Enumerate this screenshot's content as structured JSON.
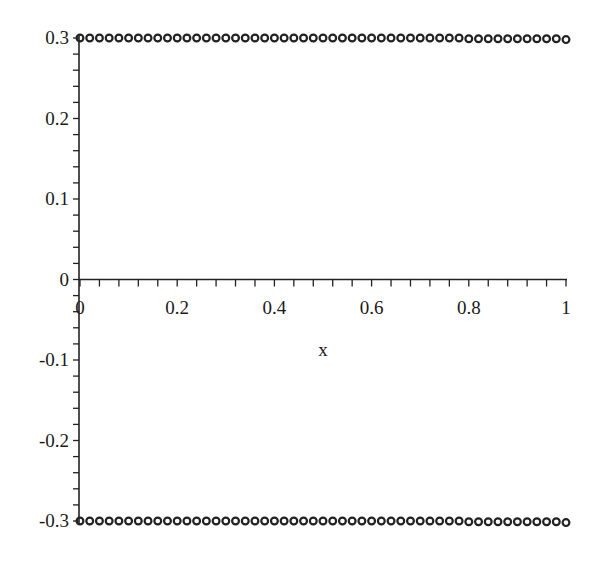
{
  "chart_data": {
    "type": "scatter",
    "title": "",
    "xlabel": "x",
    "ylabel": "",
    "xlim": [
      0,
      1
    ],
    "ylim": [
      -0.3,
      0.3
    ],
    "grid": false,
    "legend": null,
    "x_ticks": [
      {
        "value": 0,
        "label": "0"
      },
      {
        "value": 0.2,
        "label": "0.2"
      },
      {
        "value": 0.4,
        "label": "0.4"
      },
      {
        "value": 0.6,
        "label": "0.6"
      },
      {
        "value": 0.8,
        "label": "0.8"
      },
      {
        "value": 1,
        "label": "1"
      }
    ],
    "y_ticks": [
      {
        "value": 0.3,
        "label": "0.3"
      },
      {
        "value": 0.2,
        "label": "0.2"
      },
      {
        "value": 0.1,
        "label": "0.1"
      },
      {
        "value": 0,
        "label": "0"
      },
      {
        "value": -0.1,
        "label": "-0.1"
      },
      {
        "value": -0.2,
        "label": "-0.2"
      },
      {
        "value": -0.3,
        "label": "-0.3"
      }
    ],
    "x_minor_step": 0.04,
    "y_minor_step": 0.02,
    "marker": "circle",
    "marker_color": "#222222",
    "axis_color": "#222222",
    "series": [
      {
        "name": "upper",
        "x": [
          0,
          0.02,
          0.04,
          0.06,
          0.08,
          0.1,
          0.12,
          0.14,
          0.16,
          0.18,
          0.2,
          0.22,
          0.24,
          0.26,
          0.28,
          0.3,
          0.32,
          0.34,
          0.36,
          0.38,
          0.4,
          0.42,
          0.44,
          0.46,
          0.48,
          0.5,
          0.52,
          0.54,
          0.56,
          0.58,
          0.6,
          0.62,
          0.64,
          0.66,
          0.68,
          0.7,
          0.72,
          0.74,
          0.76,
          0.78,
          0.8,
          0.82,
          0.84,
          0.86,
          0.88,
          0.9,
          0.92,
          0.94,
          0.96,
          0.98,
          1.0
        ],
        "y": [
          0.3,
          0.3,
          0.3,
          0.3,
          0.3,
          0.3,
          0.3,
          0.3,
          0.3,
          0.3,
          0.3,
          0.3,
          0.3,
          0.3,
          0.3,
          0.3,
          0.3,
          0.3,
          0.3,
          0.3,
          0.3,
          0.3,
          0.3,
          0.3,
          0.3,
          0.3,
          0.3,
          0.3,
          0.3,
          0.3,
          0.3,
          0.3,
          0.3,
          0.3,
          0.3,
          0.3,
          0.3,
          0.3,
          0.3,
          0.3,
          0.299,
          0.299,
          0.299,
          0.299,
          0.299,
          0.299,
          0.299,
          0.299,
          0.299,
          0.299,
          0.298
        ]
      },
      {
        "name": "lower",
        "x": [
          0,
          0.02,
          0.04,
          0.06,
          0.08,
          0.1,
          0.12,
          0.14,
          0.16,
          0.18,
          0.2,
          0.22,
          0.24,
          0.26,
          0.28,
          0.3,
          0.32,
          0.34,
          0.36,
          0.38,
          0.4,
          0.42,
          0.44,
          0.46,
          0.48,
          0.5,
          0.52,
          0.54,
          0.56,
          0.58,
          0.6,
          0.62,
          0.64,
          0.66,
          0.68,
          0.7,
          0.72,
          0.74,
          0.76,
          0.78,
          0.8,
          0.82,
          0.84,
          0.86,
          0.88,
          0.9,
          0.92,
          0.94,
          0.96,
          0.98,
          1.0
        ],
        "y": [
          -0.3,
          -0.3,
          -0.3,
          -0.3,
          -0.3,
          -0.3,
          -0.3,
          -0.3,
          -0.3,
          -0.3,
          -0.3,
          -0.3,
          -0.3,
          -0.3,
          -0.3,
          -0.3,
          -0.3,
          -0.3,
          -0.3,
          -0.3,
          -0.3,
          -0.3,
          -0.3,
          -0.3,
          -0.3,
          -0.3,
          -0.3,
          -0.3,
          -0.3,
          -0.3,
          -0.3,
          -0.3,
          -0.3,
          -0.3,
          -0.3,
          -0.3,
          -0.3,
          -0.3,
          -0.3,
          -0.3,
          -0.301,
          -0.301,
          -0.301,
          -0.301,
          -0.301,
          -0.301,
          -0.301,
          -0.301,
          -0.301,
          -0.301,
          -0.302
        ]
      }
    ]
  },
  "layout": {
    "plot_left_px": 80,
    "plot_right_px": 566,
    "plot_top_px": 38,
    "plot_bottom_px": 521,
    "xlabel_pos": {
      "x": 323,
      "y": 356
    }
  }
}
